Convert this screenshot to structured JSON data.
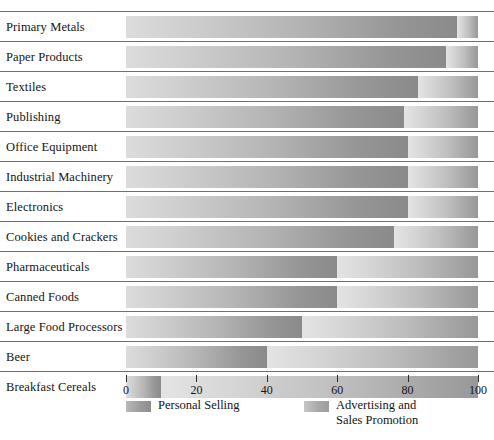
{
  "chart_data": {
    "type": "bar",
    "orientation": "horizontal",
    "stacked": true,
    "title": "",
    "subtitle": "",
    "xlabel": "",
    "ylabel": "",
    "xlim": [
      0,
      100
    ],
    "xticks": [
      0,
      20,
      40,
      60,
      80,
      100
    ],
    "xtick_labels": [
      "0",
      "20",
      "40",
      "60",
      "80",
      "100"
    ],
    "grid": false,
    "legend_position": "bottom",
    "categories": [
      "Primary Metals",
      "Paper Products",
      "Textiles",
      "Publishing",
      "Office Equipment",
      "Industrial Machinery",
      "Electronics",
      "Cookies and Crackers",
      "Pharmaceuticals",
      "Canned Foods",
      "Large Food Processors",
      "Beer",
      "Breakfast Cereals"
    ],
    "series": [
      {
        "name": "Personal Selling",
        "values": [
          94,
          91,
          83,
          79,
          80,
          80,
          80,
          76,
          60,
          60,
          50,
          40,
          10
        ]
      },
      {
        "name": "Advertising and Sales Promotion",
        "values": [
          6,
          9,
          17,
          21,
          20,
          20,
          20,
          24,
          40,
          40,
          50,
          60,
          90
        ]
      }
    ]
  },
  "legend": {
    "items": [
      {
        "label": "Personal Selling",
        "swatch": "gradient-gray-a"
      },
      {
        "label": "Advertising and\nSales Promotion",
        "swatch": "gradient-gray-b"
      }
    ]
  }
}
